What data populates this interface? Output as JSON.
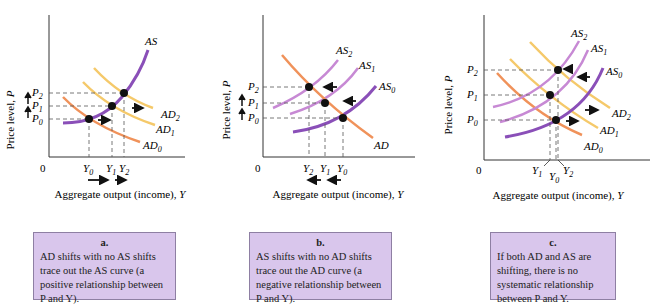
{
  "colors": {
    "as_purple": "#8a4fb8",
    "as_light": "#c789d4",
    "ad_orange": "#f0925a",
    "ad_yellow": "#f5c96a",
    "caption_bg": "#d9c6ec",
    "point": "#111111"
  },
  "common": {
    "y_axis_label": "Price level, P",
    "x_axis_label": "Aggregate output (income), Y",
    "origin": "0"
  },
  "panels": [
    {
      "id": "a",
      "curves": [
        "AS",
        "AD2",
        "AD1",
        "AD0"
      ],
      "price_labels": [
        "P2",
        "P1",
        "P0"
      ],
      "output_labels": [
        "Y0",
        "Y1",
        "Y2"
      ],
      "caption": {
        "letter": "a.",
        "lines": [
          "AD shifts with no AS shifts",
          "trace out the AS curve (a",
          "positive relationship between",
          "P and Y)."
        ]
      }
    },
    {
      "id": "b",
      "curves": [
        "AS2",
        "AS1",
        "AS0",
        "AD"
      ],
      "price_labels": [
        "P2",
        "P1",
        "P0"
      ],
      "output_labels": [
        "Y2",
        "Y1",
        "Y0"
      ],
      "caption": {
        "letter": "b.",
        "lines": [
          "AS shifts with no AD shifts",
          "trace out the AD curve (a",
          "negative relationship between",
          "P and Y)."
        ]
      }
    },
    {
      "id": "c",
      "curves": [
        "AS2",
        "AS1",
        "AS0",
        "AD2",
        "AD1",
        "AD0"
      ],
      "price_labels": [
        "P2",
        "P1",
        "P0"
      ],
      "output_labels": [
        "Y1",
        "Y0",
        "Y2"
      ],
      "caption": {
        "letter": "c.",
        "lines": [
          "If both AD and AS are",
          "shifting, there is no",
          "systematic relationship",
          "between P and Y."
        ]
      }
    }
  ]
}
